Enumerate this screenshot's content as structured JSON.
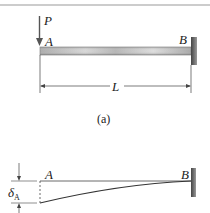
{
  "figure": {
    "part_a": {
      "load_label": "P",
      "left_end_label": "A",
      "right_end_label": "B",
      "length_label": "L",
      "caption": "(a)"
    },
    "part_b": {
      "left_end_label": "A",
      "right_end_label": "B",
      "deflection_label": "δ",
      "deflection_subscript": "A"
    },
    "colors": {
      "beam": "#b8b8b8",
      "wall": "#555555",
      "line": "#333333",
      "rule": "#bbbbbb"
    }
  }
}
